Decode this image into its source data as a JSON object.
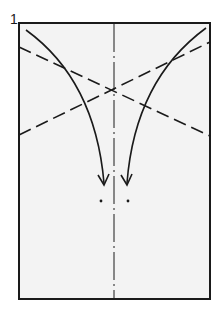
{
  "diagram": {
    "step_number": "1",
    "paper": {
      "x": 19,
      "y": 23,
      "width": 191,
      "height": 276,
      "fill": "#f3f3f3",
      "stroke": "#1a1a1a"
    },
    "center_crease": {
      "x": 114,
      "y1": 23,
      "y2": 299,
      "style": "dash-dot"
    },
    "valley_folds": [
      {
        "x1": 19,
        "y1": 47,
        "x2": 210,
        "y2": 136
      },
      {
        "x1": 19,
        "y1": 135,
        "x2": 210,
        "y2": 42
      }
    ],
    "arrows": [
      {
        "side": "left",
        "from": [
          26,
          30
        ],
        "to": [
          104,
          183
        ]
      },
      {
        "side": "right",
        "from": [
          206,
          28
        ],
        "to": [
          127,
          183
        ]
      }
    ],
    "target_dots": [
      {
        "x": 101,
        "y": 201
      },
      {
        "x": 128,
        "y": 201
      }
    ],
    "colors": {
      "line": "#1a1a1a",
      "paper": "#f3f3f3",
      "background": "#ffffff"
    }
  }
}
